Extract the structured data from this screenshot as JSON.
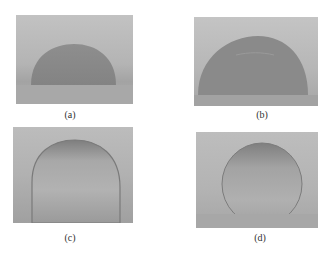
{
  "figure": {
    "panels": [
      {
        "id": "a",
        "label": "(a)"
      },
      {
        "id": "b",
        "label": "(b)"
      },
      {
        "id": "c",
        "label": "(c)"
      },
      {
        "id": "d",
        "label": "(d)"
      }
    ]
  },
  "colors": {
    "background_top": "#bdbdbd",
    "background_bottom": "#a9a9a9",
    "droplet": "#8c8c8c"
  }
}
